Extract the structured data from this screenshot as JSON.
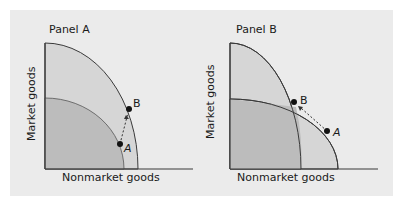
{
  "panels": [
    {
      "title": "Panel A",
      "ylabel": "Market goods",
      "xlabel": "Nonmarket goods",
      "points": [
        {
          "label": "A"
        },
        {
          "label": "B"
        }
      ]
    },
    {
      "title": "Panel B",
      "ylabel": "Market goods",
      "xlabel": "Nonmarket goods",
      "points": [
        {
          "label": "A"
        },
        {
          "label": "B"
        }
      ]
    }
  ],
  "colors": {
    "background": "#ebebeb",
    "outer_region": "#d6d6d6",
    "inner_region": "#b8b8b8",
    "curve": "#3a3a3a",
    "point": "#111111"
  }
}
